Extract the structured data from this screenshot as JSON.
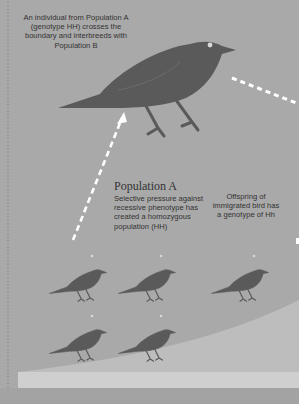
{
  "colors": {
    "background": "#a9a9a9",
    "bird": "#5a5a5a",
    "bird_eye": "#d8d8d8",
    "ground_light": "#c4c4c4",
    "ground_band": "#d0d0d0",
    "arrow": "#ffffff",
    "border_dots": "#8a8a8a",
    "text": "#333333"
  },
  "captions": {
    "top": "An individual from Population A (genotype HH) crosses the boundary and interbreeds with Population B",
    "population_a_title": "Population A",
    "population_a_desc": "Selective pressure against recessive phenotype has created a homozygous population (HH)",
    "offspring": "Offspring of immigrated bird has a genotype of Hh"
  },
  "birds": [
    {
      "id": "immigrant",
      "role": "immigrant-bird",
      "genotype": "HH"
    },
    {
      "id": "pop-a-1",
      "role": "population-a-bird",
      "genotype": "HH"
    },
    {
      "id": "pop-a-2",
      "role": "population-a-bird",
      "genotype": "HH"
    },
    {
      "id": "pop-a-3",
      "role": "population-a-bird",
      "genotype": "HH"
    },
    {
      "id": "pop-a-4",
      "role": "population-a-bird",
      "genotype": "HH"
    },
    {
      "id": "offspring",
      "role": "offspring-bird",
      "genotype": "Hh"
    }
  ],
  "arrows": [
    {
      "id": "migration-arrow",
      "meaning": "Population A bird migrates upward across boundary"
    },
    {
      "id": "interbreed-arrow",
      "meaning": "Immigrant moves toward Population B"
    }
  ]
}
